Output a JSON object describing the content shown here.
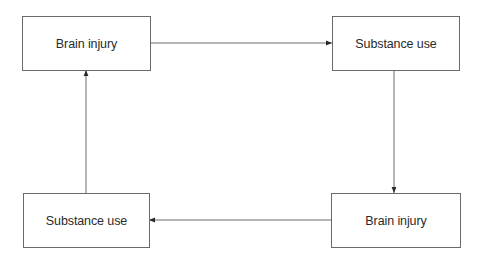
{
  "diagram": {
    "type": "cycle",
    "line_color": "#6a6a6a",
    "text_color": "#2a2a2a",
    "nodes": [
      {
        "id": "top-left",
        "label": "Brain injury"
      },
      {
        "id": "top-right",
        "label": "Substance use"
      },
      {
        "id": "bottom-right",
        "label": "Brain injury"
      },
      {
        "id": "bottom-left",
        "label": "Substance use"
      }
    ],
    "edges": [
      {
        "from": "top-left",
        "to": "top-right"
      },
      {
        "from": "top-right",
        "to": "bottom-right"
      },
      {
        "from": "bottom-right",
        "to": "bottom-left"
      },
      {
        "from": "bottom-left",
        "to": "top-left"
      }
    ]
  }
}
